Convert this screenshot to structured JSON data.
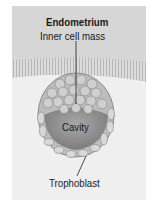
{
  "labels": {
    "title": "Endometrium",
    "inner_cell_mass": "Inner cell mass",
    "cavity": "Cavity",
    "trophoblast": "Trophoblast"
  },
  "colors": {
    "endometrium": "#d6d6d6",
    "background": "#efefef",
    "cells": "#c8c8c8",
    "cavity": "#9a9a9a"
  }
}
